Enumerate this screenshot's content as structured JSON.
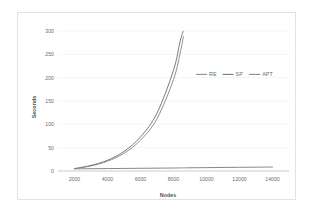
{
  "chart_data": {
    "type": "line",
    "title": "",
    "xlabel": "Nodes",
    "ylabel": "Seconds",
    "xlim": [
      1000,
      15000
    ],
    "ylim": [
      0,
      300
    ],
    "grid": "horizontal",
    "legend_position": "inside-upper-right",
    "x_ticks": [
      "2000",
      "4000",
      "6000",
      "8000",
      "10000",
      "12000",
      "14000"
    ],
    "x_tick_values": [
      2000,
      4000,
      6000,
      8000,
      10000,
      12000,
      14000
    ],
    "y_ticks": [
      "0",
      "50",
      "100",
      "150",
      "200",
      "250",
      "300"
    ],
    "y_tick_values": [
      0,
      50,
      100,
      150,
      200,
      250,
      300
    ],
    "x": [
      2000,
      3000,
      4000,
      5000,
      6000,
      7000,
      8000,
      8400,
      8600,
      9000,
      10000,
      11000,
      12000,
      13000,
      14000
    ],
    "series": [
      {
        "name": "RE",
        "color": "#8f8f8f",
        "values": [
          5,
          11,
          21,
          38,
          66,
          112,
          196,
          252,
          288,
          null,
          null,
          null,
          null,
          null,
          null
        ]
      },
      {
        "name": "SP",
        "color": "#7a7a7a",
        "values": [
          5,
          12,
          23,
          42,
          73,
          124,
          216,
          278,
          300,
          null,
          null,
          null,
          null,
          null,
          null
        ]
      },
      {
        "name": "APT",
        "color": "#878787",
        "values": [
          4.6,
          4.9,
          5.2,
          5.5,
          5.8,
          6.1,
          6.4,
          6.6,
          6.7,
          6.9,
          7.2,
          7.6,
          7.9,
          8.2,
          8.5
        ]
      }
    ]
  },
  "legend": {
    "items": [
      {
        "label": "RE"
      },
      {
        "label": "SP"
      },
      {
        "label": "APT"
      }
    ]
  },
  "axes": {
    "x_title": "Nodes",
    "y_title": "Seconds"
  }
}
